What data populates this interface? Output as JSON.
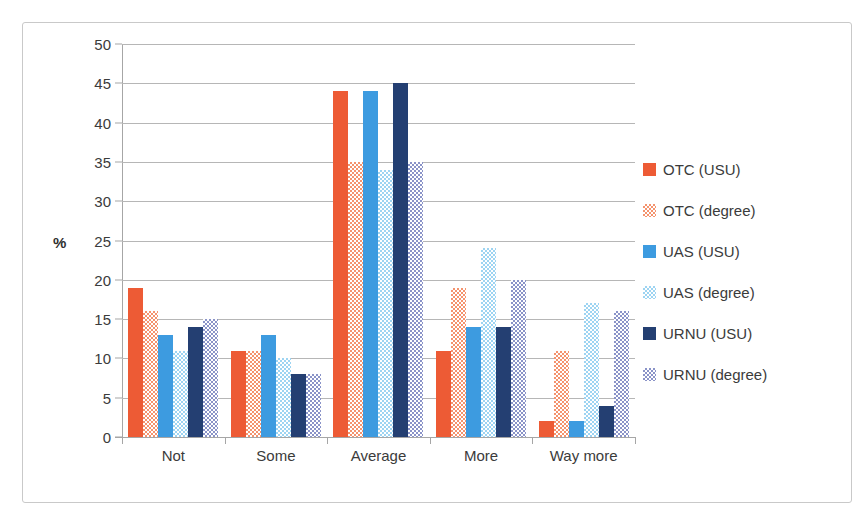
{
  "chart_data": {
    "type": "bar",
    "title": "",
    "xlabel": "",
    "ylabel": "%",
    "ylim": [
      0,
      50
    ],
    "ytick_step": 5,
    "yticks": [
      50,
      45,
      40,
      35,
      30,
      25,
      20,
      15,
      10,
      5,
      0
    ],
    "grid": true,
    "legend_position": "right",
    "categories": [
      "Not",
      "Some",
      "Average",
      "More",
      "Way more"
    ],
    "series": [
      {
        "name": "OTC (USU)",
        "values": [
          19,
          11,
          44,
          11,
          2
        ],
        "color": "#ED5B35",
        "pattern": "solid"
      },
      {
        "name": "OTC (degree)",
        "values": [
          16,
          11,
          35,
          19,
          11
        ],
        "color": "#F4936E",
        "pattern": "checker"
      },
      {
        "name": "UAS (USU)",
        "values": [
          13,
          13,
          44,
          14,
          2
        ],
        "color": "#3D9BE0",
        "pattern": "solid"
      },
      {
        "name": "UAS (degree)",
        "values": [
          11,
          10,
          34,
          24,
          17
        ],
        "color": "#9DD4F2",
        "pattern": "checker"
      },
      {
        "name": "URNU (USU)",
        "values": [
          14,
          8,
          45,
          14,
          4
        ],
        "color": "#243F72",
        "pattern": "solid"
      },
      {
        "name": "URNU (degree)",
        "values": [
          15,
          8,
          35,
          20,
          16
        ],
        "color": "#8A93C8",
        "pattern": "checker"
      }
    ]
  },
  "legend": {
    "items": [
      {
        "label": "OTC (USU)"
      },
      {
        "label": "OTC (degree)"
      },
      {
        "label": "UAS (USU)"
      },
      {
        "label": "UAS (degree)"
      },
      {
        "label": "URNU (USU)"
      },
      {
        "label": "URNU (degree)"
      }
    ]
  },
  "colors": {
    "otc_usu": "#ED5B35",
    "otc_degree": "#F4936E",
    "uas_usu": "#3D9BE0",
    "uas_degree": "#9DD4F2",
    "urnu_usu": "#243F72",
    "urnu_degree": "#8A93C8",
    "gridline": "#b6b6b6",
    "axis": "#a6a6a6",
    "border": "#c9c9c9",
    "text": "#3b3b3b"
  }
}
